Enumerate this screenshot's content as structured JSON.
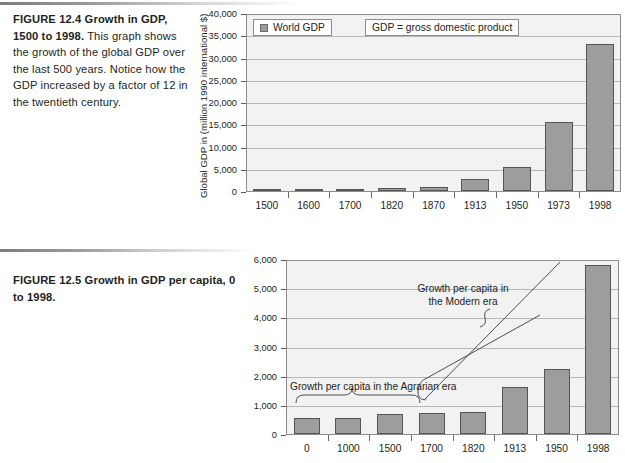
{
  "page": {
    "figures": [
      {
        "id": "12.4",
        "caption_lead": "FIGURE 12.4  Growth in GDP, 1500 to 1998.",
        "caption_body": " This graph shows the growth of the global GDP over the last 500 years. Notice how the GDP increased by a factor of 12 in the twentieth century."
      },
      {
        "id": "12.5",
        "caption_lead": "FIGURE 12.5  Growth in GDP per capita, 0 to 1998.",
        "caption_body": ""
      }
    ]
  },
  "chart_data": [
    {
      "type": "bar",
      "title": "Growth in GDP, 1500 to 1998",
      "xlabel": "",
      "ylabel": "Global GDP in (million 1990 international $)",
      "categories": [
        "1500",
        "1600",
        "1700",
        "1820",
        "1870",
        "1913",
        "1950",
        "1973",
        "1998"
      ],
      "values": [
        250,
        330,
        370,
        620,
        900,
        2700,
        5300,
        15500,
        33000
      ],
      "ylim": [
        0,
        40000
      ],
      "yticks": [
        0,
        5000,
        10000,
        15000,
        20000,
        25000,
        30000,
        35000,
        40000
      ],
      "ytick_labels": [
        "0",
        "5,000",
        "10,000",
        "15,000",
        "20,000",
        "25,000",
        "30,000",
        "35,000",
        "40,000"
      ],
      "grid": true,
      "legend_position": "top-left",
      "legend": [
        {
          "label": "World GDP",
          "color": "#9d9d9d"
        }
      ],
      "notes": [
        {
          "text": "GDP = gross domestic product"
        }
      ],
      "series_color": "#9d9d9d"
    },
    {
      "type": "bar",
      "title": "Growth in GDP per capita, 0 to 1998",
      "xlabel": "",
      "ylabel": "",
      "categories": [
        "0",
        "1000",
        "1500",
        "1700",
        "1820",
        "1913",
        "1950",
        "1998"
      ],
      "values": [
        535,
        540,
        670,
        720,
        760,
        1610,
        2220,
        5810
      ],
      "ylim": [
        0,
        6000
      ],
      "yticks": [
        0,
        1000,
        2000,
        3000,
        4000,
        5000,
        6000
      ],
      "ytick_labels": [
        "0",
        "1,000",
        "2,000",
        "3,000",
        "4,000",
        "5,000",
        "6,000"
      ],
      "grid": true,
      "legend_position": "none",
      "legend": [],
      "annotations": [
        {
          "name": "agrarian-era-annotation",
          "text": "Growth per capita in the Agrarian era"
        },
        {
          "name": "modern-era-annotation",
          "text": "Growth per capita in\nthe Modern era"
        }
      ],
      "series_color": "#9d9d9d"
    }
  ],
  "colors": {
    "bar_fill": "#9d9d9d",
    "bar_stroke": "#555555",
    "plot_bg": "#f2f2f2",
    "gridline": "#b7b7b7",
    "axis": "#8c8c8c",
    "text": "#231f20"
  }
}
